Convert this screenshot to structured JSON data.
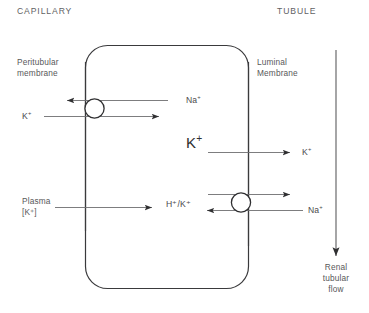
{
  "figure": {
    "title_region_labels": {
      "capillary": "CAPILLARY",
      "tubule": "TUBULE"
    },
    "membranes": {
      "peritubular_line1": "Peritubular",
      "peritubular_line2": "membrane",
      "luminal_line1": "Luminal",
      "luminal_line2": "Membrane"
    },
    "cell": {
      "label": ""
    },
    "transporters": [
      {
        "name": "na-k-atpase",
        "location": "peritubular-membrane",
        "outward_ion": "Na",
        "outward_charge": "+",
        "inward_ion": "K",
        "inward_charge": "+"
      },
      {
        "name": "h-k-atpase",
        "location": "luminal-membrane",
        "outward_ion": "H/K",
        "inward_ion": "Na",
        "inward_charge": "+"
      }
    ],
    "ion_labels": {
      "na_top": "Na",
      "na_top_charge": "+",
      "k_top": "K",
      "k_top_charge": "+",
      "k_cell_big": "K",
      "k_cell_big_charge": "+",
      "k_lumen": "K",
      "k_lumen_charge": "+",
      "hk_exchange": "H⁺/K⁺",
      "na_bottom": "Na",
      "na_bottom_charge": "+"
    },
    "plasma": {
      "line1": "Plasma",
      "line2": "[K⁺]"
    },
    "flow": {
      "line1": "Renal",
      "line2": "tubular",
      "line3": "flow"
    },
    "colors": {
      "text": "#58585a",
      "stroke_dark": "#3a3a3c",
      "stroke_light": "#6e6e70",
      "background": "#ffffff"
    }
  }
}
